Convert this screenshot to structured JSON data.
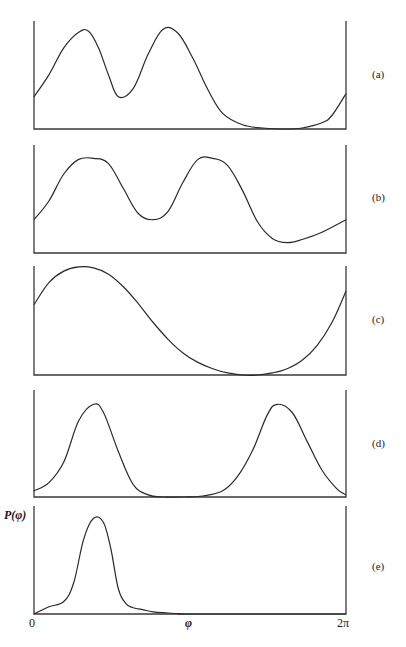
{
  "chart_data": [
    {
      "type": "line",
      "panel": "(a)",
      "title": "",
      "xlabel": "",
      "ylabel": "",
      "xlim": [
        0,
        6.2832
      ],
      "ylim": [
        0,
        1
      ],
      "grid": false,
      "x": [
        0,
        0.3,
        0.6,
        0.9,
        1.1,
        1.3,
        1.5,
        1.7,
        2.0,
        2.3,
        2.6,
        2.9,
        3.2,
        3.5,
        3.8,
        4.2,
        4.6,
        5.0,
        5.4,
        5.8,
        6.0,
        6.2832
      ],
      "values": [
        0.31,
        0.52,
        0.78,
        0.93,
        0.94,
        0.78,
        0.52,
        0.31,
        0.39,
        0.72,
        0.96,
        0.92,
        0.68,
        0.38,
        0.15,
        0.04,
        0.01,
        0.0,
        0.01,
        0.06,
        0.13,
        0.34
      ]
    },
    {
      "type": "line",
      "panel": "(b)",
      "title": "",
      "xlabel": "",
      "ylabel": "",
      "xlim": [
        0,
        6.2832
      ],
      "ylim": [
        0,
        1
      ],
      "grid": false,
      "x": [
        0,
        0.3,
        0.6,
        0.9,
        1.2,
        1.5,
        1.8,
        2.1,
        2.4,
        2.7,
        3.0,
        3.3,
        3.6,
        3.9,
        4.2,
        4.5,
        4.8,
        5.1,
        5.4,
        5.8,
        6.2832
      ],
      "values": [
        0.32,
        0.5,
        0.76,
        0.9,
        0.91,
        0.86,
        0.62,
        0.38,
        0.32,
        0.4,
        0.68,
        0.9,
        0.91,
        0.84,
        0.6,
        0.3,
        0.14,
        0.1,
        0.13,
        0.2,
        0.32
      ]
    },
    {
      "type": "line",
      "panel": "(c)",
      "title": "",
      "xlabel": "",
      "ylabel": "",
      "xlim": [
        0,
        6.2832
      ],
      "ylim": [
        0,
        1
      ],
      "grid": false,
      "x": [
        0,
        0.3,
        0.6,
        0.9,
        1.2,
        1.5,
        1.8,
        2.1,
        2.4,
        2.7,
        3.0,
        3.3,
        3.6,
        3.9,
        4.2,
        4.5,
        4.8,
        5.1,
        5.4,
        5.7,
        6.0,
        6.2832
      ],
      "values": [
        0.67,
        0.88,
        0.99,
        1.03,
        1.02,
        0.96,
        0.84,
        0.68,
        0.5,
        0.34,
        0.21,
        0.12,
        0.06,
        0.02,
        0.0,
        0.0,
        0.02,
        0.06,
        0.14,
        0.28,
        0.5,
        0.8
      ]
    },
    {
      "type": "line",
      "panel": "(d)",
      "title": "",
      "xlabel": "",
      "ylabel": "",
      "xlim": [
        0,
        6.2832
      ],
      "ylim": [
        0,
        1
      ],
      "grid": false,
      "x": [
        0,
        0.3,
        0.6,
        0.9,
        1.2,
        1.4,
        1.7,
        2.0,
        2.3,
        2.6,
        3.0,
        3.4,
        3.8,
        4.1,
        4.4,
        4.7,
        4.9,
        5.2,
        5.5,
        5.8,
        6.1,
        6.2832
      ],
      "values": [
        0.06,
        0.14,
        0.34,
        0.74,
        0.9,
        0.82,
        0.44,
        0.12,
        0.02,
        0.0,
        0.0,
        0.01,
        0.06,
        0.2,
        0.45,
        0.8,
        0.9,
        0.82,
        0.54,
        0.26,
        0.08,
        0.02
      ]
    },
    {
      "type": "line",
      "panel": "(e)",
      "title": "",
      "xlabel": "φ",
      "ylabel": "P(φ)",
      "xlim": [
        0,
        6.2832
      ],
      "ylim": [
        0,
        1
      ],
      "grid": false,
      "x": [
        0,
        0.3,
        0.6,
        0.8,
        1.0,
        1.2,
        1.4,
        1.55,
        1.7,
        1.85,
        2.0,
        2.2,
        2.4,
        2.7,
        3.0,
        3.2,
        6.2832
      ],
      "values": [
        0.0,
        0.07,
        0.12,
        0.3,
        0.72,
        0.92,
        0.88,
        0.62,
        0.24,
        0.1,
        0.06,
        0.04,
        0.02,
        0.01,
        0.0,
        0.0,
        0.0
      ],
      "x_ticks": [
        "0",
        "2π"
      ]
    }
  ],
  "figure": {
    "panel_labels": [
      "(a)",
      "(b)",
      "(c)",
      "(d)",
      "(e)"
    ],
    "ylabel": "P(φ)",
    "xlabel": "φ",
    "x_tick_start": "0",
    "x_tick_end": "2π"
  }
}
